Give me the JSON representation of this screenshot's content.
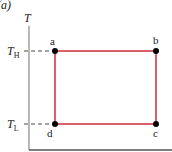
{
  "panel_label": "(a)",
  "axis": {
    "y_label": "T",
    "x_label": ""
  },
  "levels": {
    "high": {
      "label": "T",
      "sub": "H"
    },
    "low": {
      "label": "T",
      "sub": "L"
    }
  },
  "points": [
    {
      "name": "a",
      "x": 55,
      "y": 51
    },
    {
      "name": "b",
      "x": 156,
      "y": 51
    },
    {
      "name": "c",
      "x": 156,
      "y": 124
    },
    {
      "name": "d",
      "x": 55,
      "y": 124
    }
  ],
  "colors": {
    "cycle": "#d9606a",
    "axis": "#888888",
    "points": "#000000"
  }
}
